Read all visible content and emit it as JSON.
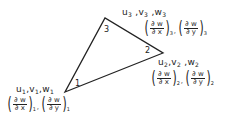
{
  "diagram": {
    "type": "triangular-finite-element",
    "stroke_color": "#222222",
    "triangle": {
      "vertices": [
        {
          "id": "1",
          "x": 65,
          "y": 92
        },
        {
          "id": "2",
          "x": 163,
          "y": 53
        },
        {
          "id": "3",
          "x": 105,
          "y": 18
        }
      ]
    },
    "vertex_labels": {
      "v1": "1",
      "v2": "2",
      "v3": "3"
    },
    "nodes": [
      {
        "id": "1",
        "dof_u": "u",
        "dof_v": "v",
        "dof_w": "w",
        "sub": "1",
        "dwdx_num": "∂ w",
        "dwdx_den": "∂ x",
        "dwdy_num": "∂ w",
        "dwdy_den": "∂ y"
      },
      {
        "id": "2",
        "dof_u": "u",
        "dof_v": "v",
        "dof_w": "w",
        "sub": "2",
        "dwdx_num": "∂ w",
        "dwdx_den": "∂ x",
        "dwdy_num": "∂ w",
        "dwdy_den": "∂ y"
      },
      {
        "id": "3",
        "dof_u": "u",
        "dof_v": "v",
        "dof_w": "w",
        "sub": "3",
        "dwdx_num": "∂ w",
        "dwdx_den": "∂ x",
        "dwdy_num": "∂ w",
        "dwdy_den": "∂ y"
      }
    ],
    "paren_open": "(",
    "paren_close": ")",
    "comma": ","
  }
}
